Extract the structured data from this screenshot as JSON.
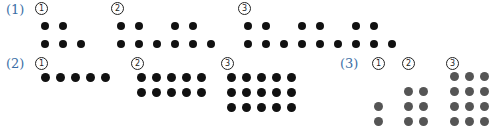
{
  "colors": {
    "label": "#3a6ea5",
    "dot_black": "#111111",
    "dot_gray": "#555555"
  },
  "sections": [
    {
      "label": "(1)",
      "figures": [
        {
          "number": "1",
          "rows": [
            [
              0,
              1
            ],
            [
              0,
              1,
              2
            ]
          ]
        },
        {
          "number": "2",
          "rows": [
            [
              0,
              1,
              3,
              4
            ],
            [
              0,
              1,
              2,
              3,
              4,
              5
            ]
          ]
        },
        {
          "number": "3",
          "rows": [
            [
              0,
              1,
              3,
              4,
              6,
              7
            ],
            [
              0,
              1,
              2,
              3,
              4,
              5,
              6,
              7,
              8
            ]
          ]
        }
      ]
    },
    {
      "label": "(2)",
      "figures": [
        {
          "number": "1",
          "grid": "1x5"
        },
        {
          "number": "2",
          "grid": "2x5"
        },
        {
          "number": "3",
          "grid": "3x5"
        }
      ]
    },
    {
      "label": "(3)",
      "figures": [
        {
          "number": "1",
          "grid": "2x1"
        },
        {
          "number": "2",
          "grid": "3x2"
        },
        {
          "number": "3",
          "grid": "4x3"
        }
      ]
    }
  ]
}
